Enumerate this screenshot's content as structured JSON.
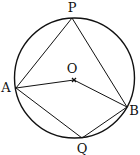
{
  "diagram": {
    "type": "circle-geometry",
    "circle": {
      "cx": 74.5,
      "cy": 78,
      "r": 60
    },
    "points": {
      "P": {
        "label": "P",
        "x": 72,
        "y": 18,
        "lx": 72,
        "ly": 12
      },
      "A": {
        "label": "A",
        "x": 16,
        "y": 88,
        "lx": 6,
        "ly": 92
      },
      "O": {
        "label": "O",
        "x": 74,
        "y": 80,
        "lx": 72,
        "ly": 73
      },
      "B": {
        "label": "B",
        "x": 127,
        "y": 107,
        "lx": 134,
        "ly": 115
      },
      "Q": {
        "label": "Q",
        "x": 82,
        "y": 138,
        "lx": 82,
        "ly": 153
      }
    },
    "segments": [
      [
        "A",
        "P"
      ],
      [
        "P",
        "B"
      ],
      [
        "A",
        "O"
      ],
      [
        "O",
        "B"
      ],
      [
        "A",
        "Q"
      ],
      [
        "Q",
        "B"
      ]
    ],
    "stroke_color": "#111111"
  }
}
